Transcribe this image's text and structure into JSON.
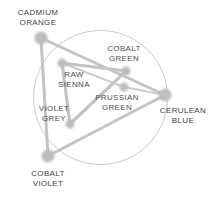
{
  "diagram": {
    "type": "color-wheel-triangle",
    "background_color": "#ffffff",
    "circle": {
      "cx": 100.5,
      "cy": 97.5,
      "r": 67,
      "stroke_color": "#c9c9c9",
      "stroke_width": 1
    },
    "palette_color": "#b9b9b9",
    "line_color": "#c4c4c4",
    "node_color": "#bdbdbd",
    "label_color": "#4a4a4a",
    "nodes": [
      {
        "id": "cadmium-orange",
        "label_line1": "CADMIUM",
        "label_line2": "ORANGE",
        "x": 41,
        "y": 38,
        "r": 6.5,
        "ring": "outer",
        "label_x": 2,
        "label_y": 8,
        "label_w": 72
      },
      {
        "id": "cerulean-blue",
        "label_line1": "CERULEAN",
        "label_line2": "BLUE",
        "x": 165,
        "y": 95,
        "r": 6.5,
        "ring": "outer",
        "label_x": 152,
        "label_y": 106,
        "label_w": 62
      },
      {
        "id": "cobalt-violet",
        "label_line1": "COBALT",
        "label_line2": "VIOLET",
        "x": 48,
        "y": 156,
        "r": 6.5,
        "ring": "outer",
        "label_x": 17,
        "label_y": 169,
        "label_w": 62
      },
      {
        "id": "cobalt-green",
        "label_line1": "COBALT",
        "label_line2": "GREEN",
        "x": 126,
        "y": 71,
        "r": 4.5,
        "ring": "inner",
        "label_x": 97,
        "label_y": 44,
        "label_w": 54
      },
      {
        "id": "raw-sienna",
        "label_line1": "RAW",
        "label_line2": "SIENNA",
        "x": 62,
        "y": 63,
        "r": 4.5,
        "ring": "inner",
        "label_x": 50,
        "label_y": 70,
        "label_w": 48
      },
      {
        "id": "violet-grey",
        "label_line1": "VIOLET",
        "label_line2": "GREY",
        "x": 70,
        "y": 124,
        "r": 4.5,
        "ring": "inner",
        "label_x": 30,
        "label_y": 104,
        "label_w": 48
      },
      {
        "id": "prussian-green",
        "label_line1": "PRUSSIAN",
        "label_line2": "GREEN",
        "x": 124,
        "y": 87,
        "r": 4.5,
        "ring": "inner",
        "label_x": 88,
        "label_y": 93,
        "label_w": 58
      }
    ],
    "edges": [
      {
        "id": "edge-orange-blue",
        "from": "cadmium-orange",
        "to": "cerulean-blue",
        "width": 3.0,
        "group": "outer"
      },
      {
        "id": "edge-blue-violet",
        "from": "cerulean-blue",
        "to": "cobalt-violet",
        "width": 3.0,
        "group": "outer"
      },
      {
        "id": "edge-violet-orange",
        "from": "cobalt-violet",
        "to": "cadmium-orange",
        "width": 3.0,
        "group": "outer"
      },
      {
        "id": "edge-sienna-green",
        "from": "raw-sienna",
        "to": "cobalt-green",
        "width": 3.2,
        "group": "inner"
      },
      {
        "id": "edge-green-grey",
        "from": "cobalt-green",
        "to": "violet-grey",
        "width": 3.2,
        "group": "inner"
      },
      {
        "id": "edge-grey-sienna",
        "from": "violet-grey",
        "to": "raw-sienna",
        "width": 3.2,
        "group": "inner"
      },
      {
        "id": "edge-prussian-blue",
        "from": "prussian-green",
        "to": "cerulean-blue",
        "width": 2.0,
        "group": "link"
      },
      {
        "id": "edge-prussian-sienna",
        "from": "prussian-green",
        "to": "raw-sienna",
        "width": 2.0,
        "group": "link"
      }
    ]
  }
}
